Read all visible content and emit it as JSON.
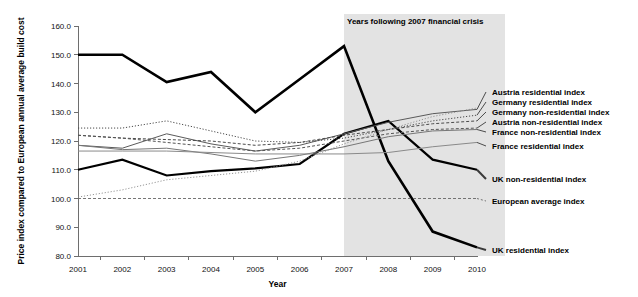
{
  "chart_data": {
    "type": "line",
    "title": "",
    "xlabel": "Year",
    "ylabel": "Price index compared to European annual average build cost",
    "x": [
      2001,
      2002,
      2003,
      2004,
      2005,
      2006,
      2007,
      2008,
      2009,
      2010
    ],
    "xtick_labels": [
      "2001",
      "2002",
      "2003",
      "2004",
      "2005",
      "2006",
      "2007",
      "2008",
      "2009",
      "2010"
    ],
    "ytick_labels": [
      "80.0",
      "90.0",
      "100.0",
      "110.0",
      "120.0",
      "130.0",
      "140.0",
      "150.0",
      "160.0"
    ],
    "yticks": [
      80,
      90,
      100,
      110,
      120,
      130,
      140,
      150,
      160
    ],
    "ylim": [
      80,
      160
    ],
    "xlim": [
      2001,
      2010
    ],
    "grid": false,
    "legend_position": "right",
    "annotation": {
      "text": "Years following 2007 financial crisis",
      "band_start": 2007,
      "band_end": 2010,
      "band_color": "#e3e3e3"
    },
    "series": [
      {
        "name": "UK residential index",
        "values": [
          150.0,
          150.0,
          140.5,
          144.0,
          130.0,
          141.5,
          153.0,
          113.0,
          88.5,
          83.0
        ],
        "style": "solid",
        "width": 2.6,
        "color": "#000000",
        "legend_label": "UK residential index"
      },
      {
        "name": "UK non-residential index",
        "values": [
          110.0,
          113.5,
          108.0,
          109.5,
          110.5,
          112.0,
          122.5,
          127.0,
          113.5,
          110.0
        ],
        "style": "solid",
        "width": 2.2,
        "color": "#000000",
        "legend_label": "UK non-residential index"
      },
      {
        "name": "Austria residential index",
        "values": [
          118.5,
          117.5,
          122.5,
          119.0,
          116.5,
          118.5,
          122.5,
          126.5,
          129.5,
          131.0
        ],
        "style": "solid",
        "width": 1.0,
        "color": "#5a5a5a",
        "legend_label": "Austria residential index"
      },
      {
        "name": "Germany residential index",
        "values": [
          124.5,
          124.5,
          127.0,
          123.5,
          120.0,
          119.5,
          121.0,
          124.0,
          127.0,
          129.0
        ],
        "style": "dotted",
        "width": 1.0,
        "color": "#4a4a4a",
        "legend_label": "Germany residential index"
      },
      {
        "name": "Germany non-residential index",
        "values": [
          122.0,
          121.0,
          120.5,
          120.0,
          118.5,
          119.5,
          122.0,
          124.0,
          126.0,
          127.0
        ],
        "style": "dashed",
        "width": 1.0,
        "color": "#4a4a4a",
        "legend_label": "Germany non-residential index"
      },
      {
        "name": "Austria non-residential index",
        "values": [
          122.0,
          121.0,
          119.5,
          118.0,
          116.5,
          117.5,
          120.0,
          122.5,
          124.0,
          124.5
        ],
        "style": "dashed",
        "width": 1.0,
        "color": "#555555",
        "legend_label": "Austria non-residential index"
      },
      {
        "name": "France non-residential index",
        "values": [
          118.5,
          117.0,
          117.5,
          115.5,
          113.0,
          115.0,
          118.0,
          121.5,
          123.5,
          124.0
        ],
        "style": "solid",
        "width": 1.0,
        "color": "#777777",
        "legend_label": "France non-residential index"
      },
      {
        "name": "France residential index",
        "values": [
          116.5,
          116.5,
          116.5,
          116.0,
          115.5,
          115.5,
          115.5,
          116.0,
          118.0,
          119.5
        ],
        "style": "solid",
        "width": 1.0,
        "color": "#8a8a8a",
        "legend_label": "France residential index"
      },
      {
        "name": "European average index",
        "values": [
          100.0,
          100.0,
          100.0,
          100.0,
          100.0,
          100.0,
          100.0,
          100.0,
          100.0,
          100.0
        ],
        "style": "dashed",
        "width": 0.9,
        "color": "#666666",
        "legend_label": "European average index"
      },
      {
        "name": "rising-dotted-unlabelled",
        "values": [
          100.5,
          103.0,
          106.5,
          108.0,
          109.5,
          113.0,
          119.0,
          124.0,
          128.5,
          131.5
        ],
        "style": "dotted",
        "width": 0.9,
        "color": "#8a8a8a",
        "legend_label": ""
      }
    ],
    "legend_entries": [
      {
        "label": "Austria residential index",
        "y_value": 131.0
      },
      {
        "label": "Germany residential index",
        "y_value": 129.0
      },
      {
        "label": "Germany non-residential index",
        "y_value": 127.0
      },
      {
        "label": "Austria non-residential index",
        "y_value": 124.5
      },
      {
        "label": "France non-residential index",
        "y_value": 124.0
      },
      {
        "label": "France residential index",
        "y_value": 119.5
      },
      {
        "label": "UK non-residential index",
        "y_value": 110.0
      },
      {
        "label": "European average index",
        "y_value": 100.0
      },
      {
        "label": "UK residential index",
        "y_value": 83.0
      }
    ]
  }
}
